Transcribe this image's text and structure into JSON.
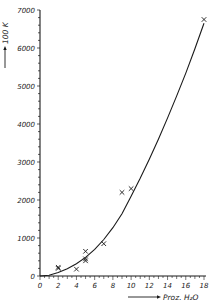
{
  "chart_data": {
    "type": "scatter",
    "title": "",
    "xlabel": "Proz. H₂O",
    "ylabel": "100 K",
    "xlim": [
      0,
      18
    ],
    "ylim": [
      0,
      7000
    ],
    "x_ticks": [
      0,
      2,
      4,
      6,
      8,
      10,
      12,
      14,
      16,
      18
    ],
    "y_ticks": [
      0,
      1000,
      2000,
      3000,
      4000,
      5000,
      6000,
      7000
    ],
    "grid": false,
    "legend": null,
    "series": [
      {
        "name": "measured",
        "marker": "x",
        "points": [
          {
            "x": 2,
            "y": 200
          },
          {
            "x": 2,
            "y": 230
          },
          {
            "x": 4,
            "y": 180
          },
          {
            "x": 5,
            "y": 650
          },
          {
            "x": 5,
            "y": 450
          },
          {
            "x": 5,
            "y": 400
          },
          {
            "x": 7,
            "y": 850
          },
          {
            "x": 9,
            "y": 2200
          },
          {
            "x": 10,
            "y": 2300
          },
          {
            "x": 18,
            "y": 6750
          }
        ]
      },
      {
        "name": "fitted curve",
        "style": "line",
        "points": [
          {
            "x": 0,
            "y": 0
          },
          {
            "x": 1,
            "y": 20
          },
          {
            "x": 2,
            "y": 90
          },
          {
            "x": 3,
            "y": 190
          },
          {
            "x": 4,
            "y": 320
          },
          {
            "x": 5,
            "y": 490
          },
          {
            "x": 6,
            "y": 700
          },
          {
            "x": 7,
            "y": 960
          },
          {
            "x": 8,
            "y": 1270
          },
          {
            "x": 9,
            "y": 1640
          },
          {
            "x": 10,
            "y": 2100
          },
          {
            "x": 11,
            "y": 2570
          },
          {
            "x": 12,
            "y": 3070
          },
          {
            "x": 13,
            "y": 3600
          },
          {
            "x": 14,
            "y": 4160
          },
          {
            "x": 15,
            "y": 4740
          },
          {
            "x": 16,
            "y": 5340
          },
          {
            "x": 17,
            "y": 5980
          },
          {
            "x": 18,
            "y": 6650
          }
        ]
      }
    ]
  },
  "labels": {
    "y_axis_title": "100 K",
    "x_axis_title": "Proz. H₂O"
  },
  "colors": {
    "ink": "#1a1a1a",
    "background": "#ffffff"
  }
}
